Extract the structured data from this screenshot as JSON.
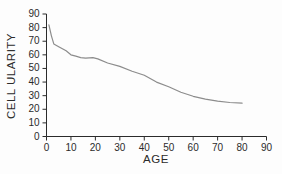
{
  "colors": {
    "background": "#fdfdfd",
    "axis": "#2b2b2b",
    "text": "#2b2b2b",
    "line": "#8c8c8c"
  },
  "chart_data": {
    "type": "line",
    "title": "",
    "xlabel": "AGE",
    "ylabel": "CELL ULARITY",
    "xlim": [
      0,
      90
    ],
    "ylim": [
      0,
      90
    ],
    "xticks": [
      0,
      10,
      20,
      30,
      40,
      50,
      60,
      70,
      80,
      90
    ],
    "yticks": [
      0,
      10,
      20,
      30,
      40,
      50,
      60,
      70,
      80,
      90
    ],
    "grid": false,
    "legend_position": "none",
    "series": [
      {
        "name": "cellularity-vs-age",
        "x": [
          1,
          2,
          3,
          5,
          8,
          10,
          12,
          14,
          16,
          19,
          21,
          25,
          30,
          35,
          40,
          45,
          50,
          55,
          60,
          65,
          70,
          75,
          80
        ],
        "y": [
          82,
          74,
          68,
          66,
          63,
          60,
          59,
          58,
          57.5,
          58,
          57,
          54,
          51.5,
          48,
          45,
          40,
          36.5,
          32.5,
          29.5,
          27.5,
          26,
          25,
          24.5
        ]
      }
    ]
  }
}
